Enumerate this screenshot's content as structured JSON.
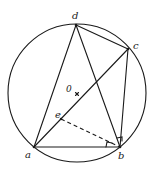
{
  "diagram": {
    "circle": {
      "center_label": "0",
      "cx": 77,
      "cy": 93,
      "r": 69
    },
    "points": {
      "a": {
        "label": "a",
        "x": 34,
        "y": 147
      },
      "b": {
        "label": "b",
        "x": 120,
        "y": 147
      },
      "c": {
        "label": "c",
        "x": 128,
        "y": 49
      },
      "d": {
        "label": "d",
        "x": 76,
        "y": 25
      },
      "e": {
        "label": "e",
        "x": 61,
        "y": 119
      },
      "O": {
        "label": "0",
        "x": 77,
        "y": 93
      }
    },
    "segments": [
      "ab",
      "ad",
      "dc",
      "cb",
      "ac",
      "db"
    ],
    "dashed_segments": [
      "eb"
    ],
    "right_angle_marks": [
      "angle abe at b",
      "angle dbc at b"
    ]
  }
}
